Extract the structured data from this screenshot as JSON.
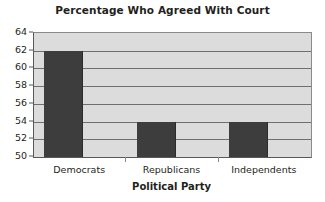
{
  "chart_data": {
    "type": "bar",
    "title": "Percentage Who Agreed With Court",
    "xlabel": "Political Party",
    "ylabel": "",
    "categories": [
      "Democrats",
      "Republicans",
      "Independents"
    ],
    "values": [
      62,
      54,
      54
    ],
    "ylim": [
      50,
      64
    ],
    "ytick_step": 2,
    "yticks": [
      64,
      62,
      60,
      58,
      56,
      54,
      52,
      50
    ],
    "ytick_labels": [
      "64",
      "62",
      "60",
      "58",
      "56",
      "54",
      "52",
      "50"
    ],
    "grid": true,
    "grid_axis": "y",
    "legend": false,
    "legend_position": "none",
    "series": [
      {
        "name": "Percentage Who Agreed With Court",
        "values": [
          62,
          54,
          54
        ]
      }
    ],
    "colors": {
      "bar_fill": "#3d3d3d",
      "plot_background": "#dcdcdc",
      "gridline": "#6f6f71",
      "axis_line": "#58585a",
      "text": "#231f20",
      "page_background": "#ffffff"
    }
  }
}
